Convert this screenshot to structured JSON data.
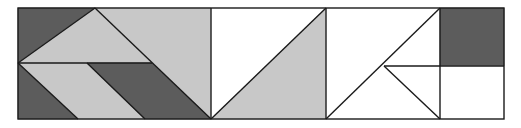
{
  "figure": {
    "colors": {
      "dark": "#5c5c5c",
      "light": "#c8c8c8",
      "white": "#ffffff",
      "stroke": "#1a1a1a"
    },
    "outer": {
      "x": 18,
      "y": 8,
      "w": 486,
      "h": 111
    },
    "shapes": [
      {
        "name": "dark-top-left-region",
        "fill": "dark",
        "points": "18,8 95,8 18,63"
      },
      {
        "name": "light-top-triangle",
        "fill": "light",
        "points": "95,8 152,63 18,63"
      },
      {
        "name": "light-top-right-parallelogram",
        "fill": "light",
        "points": "95,8 211,8 211,119 152,63"
      },
      {
        "name": "dark-bottom-left-triangle",
        "fill": "dark",
        "points": "18,63 78,119 18,119"
      },
      {
        "name": "light-bottom-parallelogram",
        "fill": "light",
        "points": "18,63 87,63 145,119 78,119"
      },
      {
        "name": "dark-bottom-parallelogram",
        "fill": "dark",
        "points": "87,63 152,63 211,119 145,119"
      },
      {
        "name": "white-middle-triangle",
        "fill": "white",
        "points": "211,8 326,8 211,119"
      },
      {
        "name": "light-middle-triangle",
        "fill": "light",
        "points": "326,8 326,119 211,119"
      },
      {
        "name": "white-right-upper-left",
        "fill": "white",
        "points": "326,8 440,8 384,66 326,119"
      },
      {
        "name": "white-right-upper-right",
        "fill": "white",
        "points": "440,8 440,66 384,66"
      },
      {
        "name": "white-right-lower-left",
        "fill": "white",
        "points": "384,66 440,119 326,119"
      },
      {
        "name": "white-right-lower-right",
        "fill": "white",
        "points": "384,66 440,66 440,119"
      },
      {
        "name": "dark-square",
        "fill": "dark",
        "points": "440,8 504,8 504,66 440,66"
      },
      {
        "name": "white-square",
        "fill": "white",
        "points": "440,66 504,66 504,119 440,119"
      }
    ],
    "lines": [
      {
        "name": "divider-1",
        "x1": 211,
        "y1": 8,
        "x2": 211,
        "y2": 119
      },
      {
        "name": "divider-2",
        "x1": 326,
        "y1": 8,
        "x2": 326,
        "y2": 119
      },
      {
        "name": "divider-3",
        "x1": 440,
        "y1": 8,
        "x2": 440,
        "y2": 119
      },
      {
        "name": "left-mid-horizontal",
        "x1": 18,
        "y1": 63,
        "x2": 152,
        "y2": 63
      },
      {
        "name": "left-diag-up",
        "x1": 18,
        "y1": 63,
        "x2": 95,
        "y2": 8
      },
      {
        "name": "left-diag-long",
        "x1": 95,
        "y1": 8,
        "x2": 211,
        "y2": 119
      },
      {
        "name": "left-diag-lower-1",
        "x1": 18,
        "y1": 63,
        "x2": 78,
        "y2": 119
      },
      {
        "name": "left-diag-lower-2",
        "x1": 87,
        "y1": 63,
        "x2": 145,
        "y2": 119
      },
      {
        "name": "middle-diag",
        "x1": 211,
        "y1": 119,
        "x2": 326,
        "y2": 8
      },
      {
        "name": "right-diag-long",
        "x1": 326,
        "y1": 119,
        "x2": 440,
        "y2": 8
      },
      {
        "name": "right-diag-short",
        "x1": 384,
        "y1": 66,
        "x2": 440,
        "y2": 119
      },
      {
        "name": "right-mid-horizontal",
        "x1": 384,
        "y1": 66,
        "x2": 504,
        "y2": 66
      }
    ]
  }
}
